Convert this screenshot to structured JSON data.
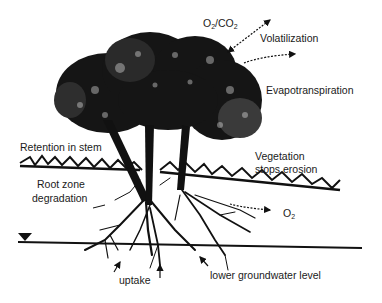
{
  "diagram": {
    "type": "phytoremediation-processes",
    "labels": {
      "o2co2": {
        "main1": "O",
        "sub1": "2",
        "main2": "/CO",
        "sub2": "2"
      },
      "volatilization": "Volatilization",
      "evapotranspiration": "Evapotranspiration",
      "retention": "Retention in stem",
      "vegetation_line1": "Vegetation",
      "vegetation_line2": "stops erosion",
      "root_zone_line1": "Root zone",
      "root_zone_line2": "degradation",
      "o2": {
        "main": "O",
        "sub": "2"
      },
      "uptake": "uptake",
      "groundwater": "lower groundwater level"
    },
    "elements": {
      "tree": "tree-with-three-trunks",
      "grass": "ground-vegetation-line",
      "roots": "root-system",
      "water_table": "groundwater-line",
      "water_table_marker": "inverted-triangle"
    },
    "colors": {
      "ink": "#111111",
      "background": "#ffffff"
    }
  }
}
